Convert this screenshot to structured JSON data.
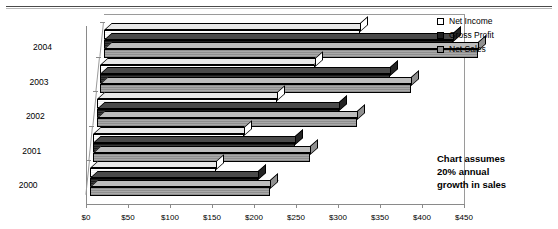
{
  "chart_data": {
    "type": "bar",
    "orientation": "horizontal",
    "style": "3d-clustered",
    "title": "",
    "xlabel": "",
    "ylabel": "",
    "categories": [
      "2000",
      "2001",
      "2002",
      "2003",
      "2004"
    ],
    "series": [
      {
        "name": "Net Income",
        "values": [
          150,
          180,
          215,
          255,
          305
        ]
      },
      {
        "name": "Gross Profit",
        "values": [
          200,
          240,
          288,
          345,
          415
        ]
      },
      {
        "name": "Net Sales",
        "values": [
          215,
          258,
          310,
          370,
          445
        ]
      }
    ],
    "series_order_top_to_bottom": [
      "Net Income",
      "Gross Profit",
      "Net Sales"
    ],
    "xlim": [
      0,
      450
    ],
    "xtick_values": [
      0,
      50,
      100,
      150,
      200,
      250,
      300,
      350,
      400,
      450
    ],
    "xtick_labels": [
      "$0",
      "$50",
      "$100",
      "$150",
      "$200",
      "$250",
      "$300",
      "$350",
      "$400",
      "$450"
    ],
    "grid": false,
    "legend_position": "top-right",
    "annotation": "Chart assumes 20% annual growth in sales"
  },
  "legend": {
    "items": [
      {
        "label": "Net Income",
        "swatch": "white"
      },
      {
        "label": "Gross Profit",
        "swatch": "black"
      },
      {
        "label": "Net Sales",
        "swatch": "gray"
      }
    ]
  },
  "annotation": {
    "line1": "Chart assumes",
    "line2": "20% annual",
    "line3": "growth in sales"
  },
  "colors": {
    "net_income": "#ffffff",
    "gross_profit": "#1f1f1f",
    "net_sales": "#8f8f8f",
    "axis": "#8a8a8a",
    "text": "#000000"
  }
}
